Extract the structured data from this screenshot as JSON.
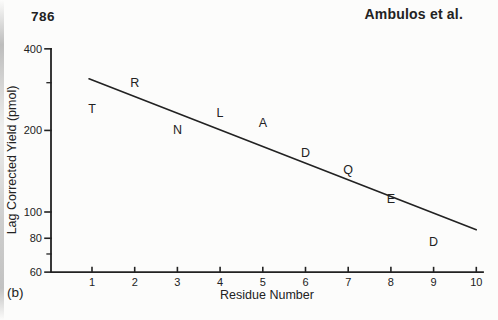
{
  "header": {
    "page_number": "786",
    "running_head": "Ambulos et al."
  },
  "footer": {
    "panel_label": "(b)"
  },
  "colors": {
    "ink": "#222222",
    "paper": "#fcfcfb"
  },
  "chart_data": {
    "type": "scatter",
    "title": "",
    "xlabel": "Residue Number",
    "ylabel": "Lag Corrected Yield (pmol)",
    "y_scale": "log",
    "ylim": [
      60,
      400
    ],
    "xlim": [
      1,
      10
    ],
    "x_ticks": [
      1,
      2,
      3,
      4,
      5,
      6,
      7,
      8,
      9,
      10
    ],
    "y_major_ticks": [
      400,
      200,
      100,
      80,
      60
    ],
    "y_minor_ticks": [
      300,
      70
    ],
    "grid": false,
    "legend": "none",
    "marker_style": "amino-acid letter as data marker",
    "points": [
      {
        "residue": 1,
        "amino_acid": "T",
        "yield_pmol": 240
      },
      {
        "residue": 2,
        "amino_acid": "R",
        "yield_pmol": 300
      },
      {
        "residue": 3,
        "amino_acid": "N",
        "yield_pmol": 202
      },
      {
        "residue": 4,
        "amino_acid": "L",
        "yield_pmol": 232
      },
      {
        "residue": 5,
        "amino_acid": "A",
        "yield_pmol": 214
      },
      {
        "residue": 6,
        "amino_acid": "D",
        "yield_pmol": 166
      },
      {
        "residue": 7,
        "amino_acid": "Q",
        "yield_pmol": 144
      },
      {
        "residue": 8,
        "amino_acid": "E",
        "yield_pmol": 112
      },
      {
        "residue": 9,
        "amino_acid": "D",
        "yield_pmol": 78
      }
    ],
    "fit_line": {
      "x1": 0.93,
      "y1": 310,
      "x2": 10.0,
      "y2": 86
    }
  }
}
